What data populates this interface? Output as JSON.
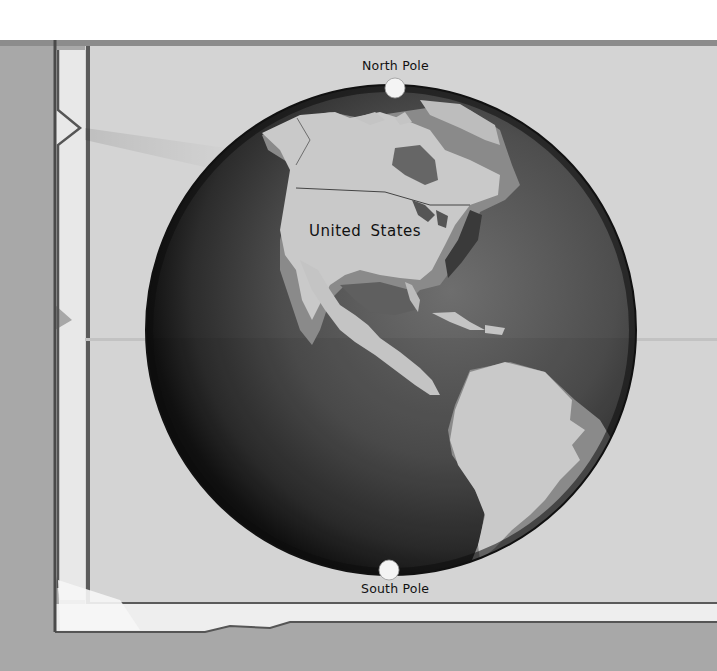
{
  "image": {
    "description": "Illustrated globe on a folded paper map showing the Western Hemisphere with North and South Poles marked",
    "tone": "grayscale"
  },
  "labels": {
    "north_pole": "North Pole",
    "south_pole": "South Pole",
    "country": "United States"
  },
  "colors": {
    "background_top": "#ffffff",
    "table_surface": "#a9a9a9",
    "paper": "#d6d6d6",
    "paper_border": "#5a5a5a",
    "ocean_dark": "#2a2a2a",
    "ocean_mid": "#5c5c5c",
    "land_light": "#c8c8c8",
    "land_shadow": "#8a8a8a",
    "pole_marker": "#f4f4f4"
  }
}
